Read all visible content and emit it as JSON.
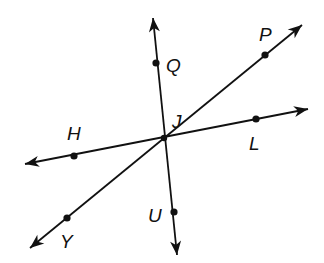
{
  "diagram": {
    "type": "intersecting-lines",
    "colors": {
      "line": "#111111",
      "background": "#ffffff"
    },
    "intersection": {
      "label": "J",
      "x": 164,
      "y": 138,
      "label_x": 172,
      "label_y": 128
    },
    "lines": [
      {
        "name": "line-QU",
        "start": {
          "x": 153,
          "y": 18
        },
        "end": {
          "x": 177,
          "y": 255
        },
        "points": [
          {
            "label": "Q",
            "x": 156,
            "y": 63,
            "label_x": 166,
            "label_y": 72
          },
          {
            "label": "U",
            "x": 174,
            "y": 212,
            "label_x": 148,
            "label_y": 222
          }
        ]
      },
      {
        "name": "line-PY",
        "start": {
          "x": 302,
          "y": 25
        },
        "end": {
          "x": 30,
          "y": 248
        },
        "points": [
          {
            "label": "P",
            "x": 265,
            "y": 55,
            "label_x": 259,
            "label_y": 41
          },
          {
            "label": "Y",
            "x": 67,
            "y": 218,
            "label_x": 60,
            "label_y": 248
          }
        ]
      },
      {
        "name": "line-HL",
        "start": {
          "x": 25,
          "y": 164
        },
        "end": {
          "x": 308,
          "y": 109
        },
        "points": [
          {
            "label": "H",
            "x": 74,
            "y": 156,
            "label_x": 67,
            "label_y": 140
          },
          {
            "label": "L",
            "x": 256,
            "y": 119,
            "label_x": 249,
            "label_y": 150
          }
        ]
      }
    ]
  }
}
